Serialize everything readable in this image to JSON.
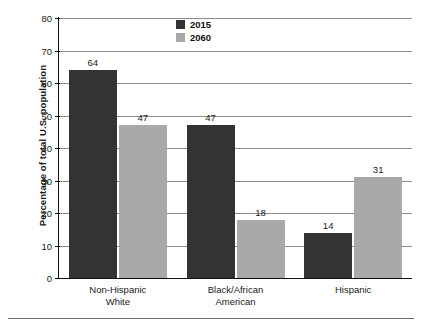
{
  "chart_data": {
    "type": "bar",
    "title": "",
    "subtitle": "",
    "xlabel": "",
    "ylabel": "Percentage of total U.S. population",
    "ylim": [
      0,
      80
    ],
    "ytick_step": 10,
    "yticks": [
      0,
      10,
      20,
      30,
      40,
      50,
      60,
      70,
      80
    ],
    "ytick_labels": [
      "0",
      "10",
      "20",
      "30",
      "40",
      "50",
      "60",
      "70",
      "80"
    ],
    "grid": true,
    "grid_axis": "y",
    "legend_position": "top-center",
    "categories": [
      "Non-Hispanic White",
      "Black/African American",
      "Hispanic"
    ],
    "category_lines": [
      [
        "Non-Hispanic",
        "White"
      ],
      [
        "Black/African",
        "American"
      ],
      [
        "Hispanic"
      ]
    ],
    "series": [
      {
        "name": "2015",
        "color": "#333333",
        "values": [
          64,
          47,
          14
        ]
      },
      {
        "name": "2060",
        "color": "#a9a9a9",
        "values": [
          47,
          18,
          31
        ]
      }
    ],
    "series_by_category": [
      {
        "category": "Non-Hispanic White",
        "2015": 64,
        "2060": 47
      },
      {
        "category": "Black/African American",
        "2015": 14,
        "2060": 18
      },
      {
        "category": "Hispanic",
        "2015": 18,
        "2060": 31
      }
    ],
    "bars": [
      {
        "group": 0,
        "series": "2015",
        "value": 64,
        "label": "64"
      },
      {
        "group": 0,
        "series": "2060",
        "value": 47,
        "label": "47"
      },
      {
        "group": 1,
        "series": "2015",
        "value": 14,
        "label": "14"
      },
      {
        "group": 1,
        "series": "2060",
        "value": 18,
        "label": "18"
      },
      {
        "group": 2,
        "series": "2015",
        "value": 18,
        "label": "18"
      },
      {
        "group": 2,
        "series": "2060",
        "value": 31,
        "label": "31"
      }
    ],
    "data_labels_shown": true
  },
  "legend": {
    "items": [
      {
        "label": "2015",
        "color": "#333333"
      },
      {
        "label": "2060",
        "color": "#a9a9a9"
      }
    ]
  },
  "colors": {
    "series_2015": "#333333",
    "series_2060": "#a9a9a9",
    "gridline": "#8e8e8e",
    "axis": "#111111",
    "text": "#1a1a1a",
    "background": "#ffffff",
    "rule": "#6f6f6f"
  }
}
